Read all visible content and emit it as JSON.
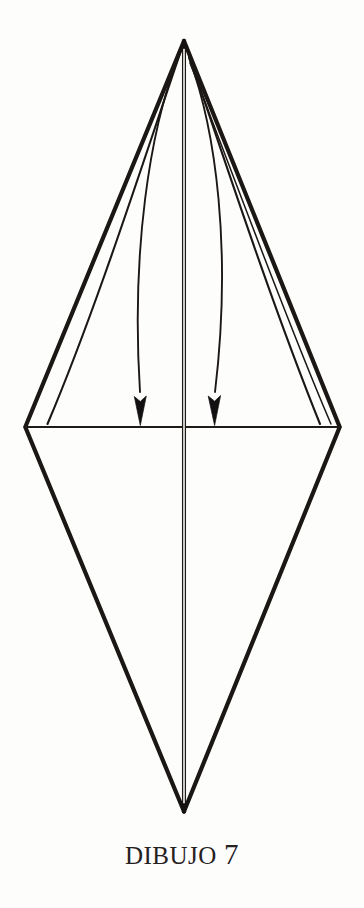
{
  "page": {
    "background_color": "#fdfdfc",
    "ink_color": "#1a1715",
    "width": 364,
    "height": 908
  },
  "caption": {
    "text": "DIBUJO 7",
    "word": "DIBUJO",
    "number": "7"
  },
  "diagram": {
    "name": "origami-kite-base-fold-step",
    "type": "origami-fold-diagram",
    "vertices": {
      "top_apex": [
        184,
        40
      ],
      "left_vertex": [
        25,
        427
      ],
      "right_vertex": [
        340,
        427
      ],
      "bottom_apex": [
        184,
        812
      ]
    },
    "lines": [
      {
        "name": "outer-edge-top-left",
        "from": [
          184,
          40
        ],
        "to": [
          25,
          427
        ],
        "weight": "thick"
      },
      {
        "name": "outer-edge-top-right",
        "from": [
          184,
          40
        ],
        "to": [
          340,
          427
        ],
        "weight": "thick"
      },
      {
        "name": "outer-edge-bottom-left",
        "from": [
          25,
          427
        ],
        "to": [
          184,
          812
        ],
        "weight": "thick"
      },
      {
        "name": "outer-edge-bottom-right",
        "from": [
          340,
          427
        ],
        "to": [
          184,
          812
        ],
        "weight": "thick"
      },
      {
        "name": "horizontal-fold-line",
        "from": [
          25,
          427
        ],
        "to": [
          340,
          427
        ],
        "weight": "thin"
      },
      {
        "name": "vertical-center-fold-line",
        "from": [
          184,
          45
        ],
        "to": [
          184,
          810
        ],
        "weight": "thin"
      },
      {
        "name": "inner-flap-edge-left",
        "from": [
          184,
          44
        ],
        "to": [
          47,
          424
        ],
        "weight": "medium"
      },
      {
        "name": "inner-flap-edge-right",
        "from": [
          184,
          44
        ],
        "to": [
          321,
          424
        ],
        "weight": "medium"
      },
      {
        "name": "inner-flap-edge-right-second",
        "from": [
          190,
          62
        ],
        "to": [
          331,
          424
        ],
        "weight": "thin"
      }
    ],
    "arrows": [
      {
        "name": "fold-arrow-left",
        "start": [
          178,
          60
        ],
        "end": [
          146,
          425
        ],
        "direction": "down",
        "style": "curved",
        "head": "solid-triangle"
      },
      {
        "name": "fold-arrow-right",
        "start": [
          190,
          60
        ],
        "end": [
          216,
          425
        ],
        "direction": "down",
        "style": "curved",
        "head": "solid-triangle"
      }
    ]
  }
}
